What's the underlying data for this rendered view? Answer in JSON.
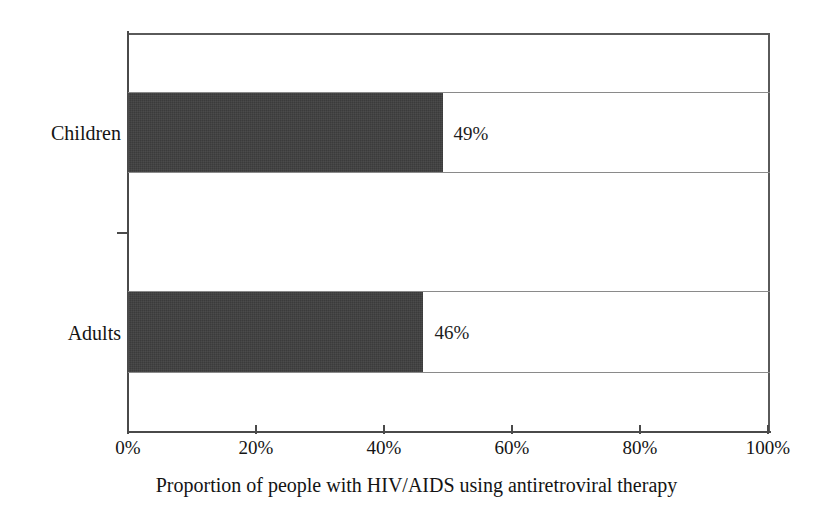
{
  "chart_data": {
    "type": "bar",
    "orientation": "horizontal",
    "title": "",
    "xlabel": "Proportion of people with HIV/AIDS using antiretroviral therapy",
    "ylabel": "",
    "categories": [
      "Children",
      "Adults"
    ],
    "values": [
      49,
      46
    ],
    "data_labels": [
      "49%",
      "46%"
    ],
    "xlim": [
      0,
      100
    ],
    "xticks": [
      0,
      20,
      40,
      60,
      80,
      100
    ],
    "xtick_labels": [
      "0%",
      "20%",
      "40%",
      "60%",
      "80%",
      "100%"
    ],
    "grid": true,
    "legend": null,
    "bar_color": "#3b3b3b",
    "axis_color": "#4a4a4a",
    "gridline_color": "#8a8a8a",
    "background_color": "#ffffff",
    "units": "percent"
  },
  "axis": {
    "x_title": "Proportion of people with HIV/AIDS using antiretroviral therapy",
    "ticks": [
      {
        "label": "0%",
        "value": 0
      },
      {
        "label": "20%",
        "value": 20
      },
      {
        "label": "40%",
        "value": 40
      },
      {
        "label": "60%",
        "value": 60
      },
      {
        "label": "80%",
        "value": 80
      },
      {
        "label": "100%",
        "value": 100
      }
    ]
  },
  "series": [
    {
      "category": "Children",
      "value": 49,
      "label": "49%"
    },
    {
      "category": "Adults",
      "value": 46,
      "label": "46%"
    }
  ]
}
